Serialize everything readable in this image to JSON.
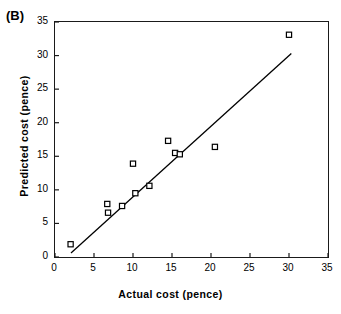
{
  "figure": {
    "panel_label": "(B)",
    "background_color": "#ffffff",
    "foreground_color": "#000000"
  },
  "chart_data": {
    "type": "scatter",
    "title": "(B)",
    "xlabel": "Actual cost (pence)",
    "ylabel": "Predicted cost (pence)",
    "xlim": [
      0,
      35
    ],
    "ylim": [
      0,
      35
    ],
    "xticks": [
      0,
      5,
      10,
      15,
      20,
      25,
      30,
      35
    ],
    "yticks": [
      0,
      5,
      10,
      15,
      20,
      25,
      30,
      35
    ],
    "xtick_labels": [
      "0",
      "5",
      "10",
      "15",
      "20",
      "25",
      "30",
      "35"
    ],
    "ytick_labels": [
      "0",
      "5",
      "10",
      "15",
      "20",
      "25",
      "30",
      "35"
    ],
    "grid": false,
    "legend": null,
    "marker": "open-square",
    "marker_color": "#000000",
    "points": [
      {
        "x": 2.0,
        "y": 1.9
      },
      {
        "x": 6.7,
        "y": 7.9
      },
      {
        "x": 6.8,
        "y": 6.6
      },
      {
        "x": 8.6,
        "y": 7.6
      },
      {
        "x": 10.0,
        "y": 13.9
      },
      {
        "x": 10.3,
        "y": 9.5
      },
      {
        "x": 12.1,
        "y": 10.6
      },
      {
        "x": 14.5,
        "y": 17.3
      },
      {
        "x": 15.4,
        "y": 15.5
      },
      {
        "x": 16.0,
        "y": 15.3
      },
      {
        "x": 20.5,
        "y": 16.4
      },
      {
        "x": 30.0,
        "y": 33.1
      }
    ],
    "trendline": {
      "type": "line",
      "x_start": 2.05,
      "y_start": 0.6,
      "x_end": 30.3,
      "y_end": 30.3,
      "color": "#000000",
      "width": 1.3
    }
  }
}
